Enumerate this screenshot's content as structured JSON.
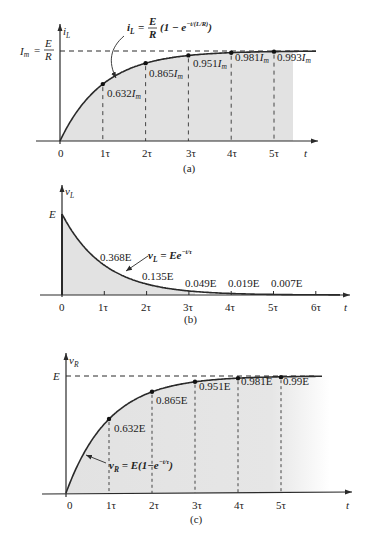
{
  "chart_data": [
    {
      "panel": "(a)",
      "type": "line",
      "title": "",
      "caption": "(a)",
      "xlabel": "t",
      "ylabel": "i_L",
      "x_ticks": [
        "0",
        "1τ",
        "2τ",
        "3τ",
        "4τ",
        "5τ"
      ],
      "x": [
        0,
        1,
        2,
        3,
        4,
        5
      ],
      "series": [
        {
          "name": "i_L",
          "values": [
            0,
            0.632,
            0.865,
            0.951,
            0.981,
            0.993
          ]
        }
      ],
      "point_labels": [
        "0.632I_m",
        "0.865I_m",
        "0.951I_m",
        "0.981I_m",
        "0.993I_m"
      ],
      "asymptote_label": "I_m = E/R",
      "equation": "i_L = E/R (1 − e^{−t/(L/R)})",
      "ylim": [
        0,
        1
      ],
      "grid": false
    },
    {
      "panel": "(b)",
      "type": "line",
      "caption": "(b)",
      "xlabel": "t",
      "ylabel": "v_L",
      "x_ticks": [
        "0",
        "1τ",
        "2τ",
        "3τ",
        "4τ",
        "5τ",
        "6τ"
      ],
      "x": [
        0,
        1,
        2,
        3,
        4,
        5
      ],
      "series": [
        {
          "name": "v_L",
          "values": [
            1,
            0.368,
            0.135,
            0.049,
            0.019,
            0.007
          ]
        }
      ],
      "point_labels": [
        "0.368E",
        "0.135E",
        "0.049E",
        "0.019E",
        "0.007E"
      ],
      "start_label": "E",
      "equation": "v_L = Ee^{−t/τ}",
      "ylim": [
        0,
        1
      ],
      "grid": false
    },
    {
      "panel": "(c)",
      "type": "line",
      "caption": "(c)",
      "xlabel": "t",
      "ylabel": "v_R",
      "x_ticks": [
        "0",
        "1τ",
        "2τ",
        "3τ",
        "4τ",
        "5τ"
      ],
      "x": [
        0,
        1,
        2,
        3,
        4,
        5
      ],
      "series": [
        {
          "name": "v_R",
          "values": [
            0,
            0.632,
            0.865,
            0.951,
            0.981,
            0.99
          ]
        }
      ],
      "point_labels": [
        "0.632E",
        "0.865E",
        "0.951E",
        "0.981E",
        "0.99E"
      ],
      "asymptote_label": "E",
      "equation": "v_R = E(1 − e^{−t/τ})",
      "ylim": [
        0,
        1
      ],
      "grid": false
    }
  ],
  "panels": {
    "a": {
      "caption": "(a)",
      "ylabel": "i",
      "ylabel_sub": "L",
      "xlabel": "t",
      "asym_lhs": "I",
      "asym_lhs_sub": "m",
      "asym_eq": "=",
      "asym_num": "E",
      "asym_den": "R",
      "eq_lhs": "i",
      "eq_lhs_sub": "L",
      "eq_eq": "=",
      "eq_num": "E",
      "eq_den": "R",
      "eq_rest": "(1 − e",
      "eq_exp": "−t/(L/R)",
      "eq_close": ")",
      "ticks": [
        "0",
        "1τ",
        "2τ",
        "3τ",
        "4τ",
        "5τ"
      ],
      "labels": [
        "0.632",
        "0.865",
        "0.951",
        "0.981",
        "0.993"
      ],
      "label_unit": "I",
      "label_unit_sub": "m"
    },
    "b": {
      "caption": "(b)",
      "ylabel": "v",
      "ylabel_sub": "L",
      "xlabel": "t",
      "start": "E",
      "eq_lhs": "v",
      "eq_lhs_sub": "L",
      "eq_rest": " = Ee",
      "eq_exp": "−t/τ",
      "ticks": [
        "0",
        "1τ",
        "2τ",
        "3τ",
        "4τ",
        "5τ",
        "6τ"
      ],
      "labels": [
        "0.368E",
        "0.135E",
        "0.049E",
        "0.019E",
        "0.007E"
      ]
    },
    "c": {
      "caption": "(c)",
      "ylabel": "v",
      "ylabel_sub": "R",
      "xlabel": "t",
      "asym": "E",
      "eq_lhs": "v",
      "eq_lhs_sub": "R",
      "eq_rest": " = E(1−e",
      "eq_exp": "−t/τ",
      "eq_close": ")",
      "ticks": [
        "0",
        "1τ",
        "2τ",
        "3τ",
        "4τ",
        "5τ"
      ],
      "labels": [
        "0.632E",
        "0.865E",
        "0.951E",
        "0.981E",
        "0.99E"
      ]
    }
  },
  "colors": {
    "shade": "#e2e2e2",
    "line": "#2a2a2a",
    "text": "#222222"
  }
}
